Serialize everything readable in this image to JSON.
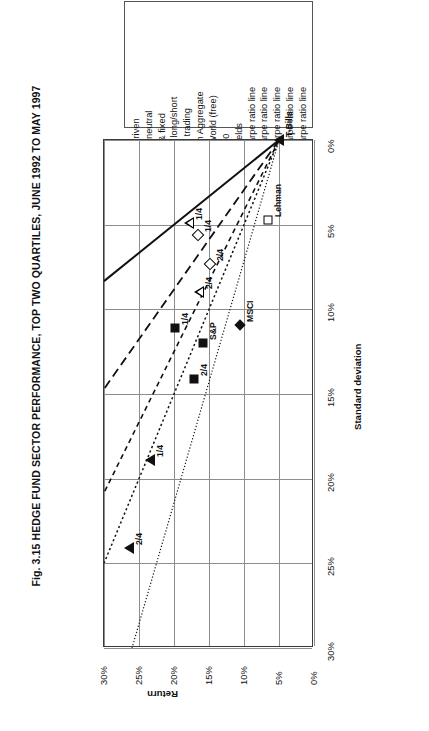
{
  "figure": {
    "title": "Fig. 3.15 HEDGE FUND SECTOR PERFORMANCE, TOP TWO QUARTILES, JUNE 1992 TO MAY 1997"
  },
  "legend": {
    "items": [
      {
        "label": "Event driven",
        "marker": "open-diamond-icon"
      },
      {
        "label": "Market neutral",
        "marker": "open-triangle-icon"
      },
      {
        "label": "Equity & fixed",
        "marker": "filled-square-icon"
      },
      {
        "label": "income long/short",
        "marker": "none"
      },
      {
        "label": "Tactical trading",
        "marker": "filled-triangle-icon"
      },
      {
        "label": "Lehman Aggregate",
        "marker": "open-square-icon"
      },
      {
        "label": "MSCI World (free)",
        "marker": "filled-diamond-icon"
      },
      {
        "label": "S&P 500",
        "marker": "filled-square-icon"
      },
      {
        "label": "T-Bill yields",
        "marker": "filled-triangle-icon"
      },
      {
        "label": "3.0 Sharpe ratio line",
        "marker": "solid-line-icon"
      },
      {
        "label": "1.7 Sharpe ratio line",
        "marker": "long-dash-line-icon"
      },
      {
        "label": "1.2 Sharpe ratio line",
        "marker": "dash-line-icon"
      },
      {
        "label": "1.0 Sharpe ratio line",
        "marker": "dotted-line-icon"
      },
      {
        "label": "0.7 Sharpe ratio line",
        "marker": "fine-dotted-line-icon"
      }
    ]
  },
  "axes": {
    "x": {
      "title": "Standard deviation",
      "ticks": [
        "0%",
        "5%",
        "10%",
        "15%",
        "20%",
        "25%",
        "30%"
      ],
      "min": 0,
      "max": 30
    },
    "y": {
      "title": "Return",
      "ticks": [
        "0%",
        "5%",
        "10%",
        "15%",
        "20%",
        "25%",
        "30%"
      ],
      "min": 0,
      "max": 30
    }
  },
  "chart_data": {
    "type": "scatter",
    "title": "Fig. 3.15 HEDGE FUND SECTOR PERFORMANCE, TOP TWO QUARTILES, JUNE 1992 TO MAY 1997",
    "xlabel": "Standard deviation",
    "ylabel": "Return",
    "xlim": [
      0,
      30
    ],
    "ylim": [
      0,
      30
    ],
    "grid": true,
    "legend_position": "top",
    "risk_free_rate": 5.0,
    "points": [
      {
        "name": "Event driven 1/4",
        "series": "Event driven",
        "quartile": "1/4",
        "marker": "open-diamond",
        "x": 5.6,
        "y": 16.6,
        "label": "1/4"
      },
      {
        "name": "Event driven 2/4",
        "series": "Event driven",
        "quartile": "2/4",
        "marker": "open-diamond",
        "x": 7.3,
        "y": 14.9,
        "label": "2/4"
      },
      {
        "name": "Market neutral 1/4",
        "series": "Market neutral",
        "quartile": "1/4",
        "marker": "open-triangle",
        "x": 4.9,
        "y": 17.8,
        "label": "1/4"
      },
      {
        "name": "Market neutral 2/4",
        "series": "Market neutral",
        "quartile": "2/4",
        "marker": "open-triangle",
        "x": 9.0,
        "y": 16.4,
        "label": "2/4"
      },
      {
        "name": "Equity & fixed income long/short 1/4",
        "series": "Equity & fixed income long/short",
        "quartile": "1/4",
        "marker": "filled-square",
        "x": 11.1,
        "y": 19.8,
        "label": "1/4"
      },
      {
        "name": "Equity & fixed income long/short 2/4",
        "series": "Equity & fixed income long/short",
        "quartile": "2/4",
        "marker": "filled-square",
        "x": 14.1,
        "y": 17.1,
        "label": "2/4"
      },
      {
        "name": "Tactical trading 1/4",
        "series": "Tactical trading",
        "quartile": "1/4",
        "marker": "filled-triangle",
        "x": 18.9,
        "y": 23.5,
        "label": "1/4"
      },
      {
        "name": "Tactical trading 2/4",
        "series": "Tactical trading",
        "quartile": "2/4",
        "marker": "filled-triangle",
        "x": 24.1,
        "y": 26.5,
        "label": "2/4"
      },
      {
        "name": "S&P 500",
        "series": "S&P 500",
        "marker": "filled-square",
        "x": 12.0,
        "y": 15.9,
        "label": "S&P"
      },
      {
        "name": "MSCI World (free)",
        "series": "MSCI World (free)",
        "marker": "filled-diamond",
        "x": 10.9,
        "y": 10.6,
        "label": "MSCI"
      },
      {
        "name": "Lehman Aggregate",
        "series": "Lehman Aggregate",
        "marker": "open-square",
        "x": 4.7,
        "y": 6.6,
        "label": "Lehman"
      },
      {
        "name": "T-Bill yields",
        "series": "T-Bill yields",
        "marker": "filled-triangle",
        "x": 0.0,
        "y": 5.0,
        "label": "T-Bills"
      }
    ],
    "sharpe_lines": [
      {
        "ratio": 3.0,
        "style": "solid",
        "intercept": 5.0
      },
      {
        "ratio": 1.7,
        "style": "long-dash",
        "intercept": 5.0
      },
      {
        "ratio": 1.2,
        "style": "dash",
        "intercept": 5.0
      },
      {
        "ratio": 1.0,
        "style": "dotted",
        "intercept": 5.0
      },
      {
        "ratio": 0.7,
        "style": "fine-dotted",
        "intercept": 5.0
      }
    ]
  }
}
